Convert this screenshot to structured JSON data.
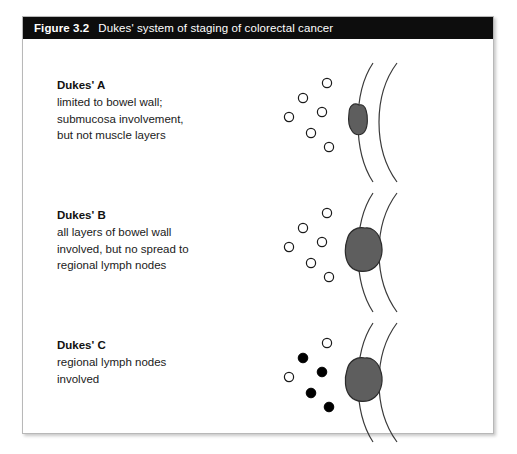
{
  "figure": {
    "number": "Figure 3.2",
    "title": "Dukes' system of staging of colorectal cancer"
  },
  "stages": [
    {
      "id": "dukes-a",
      "label": "Dukes' A",
      "description_lines": [
        "limited to bowel wall;",
        "submucosa involvement,",
        "but not muscle layers"
      ],
      "diagram": {
        "tumor_size": "small",
        "tumor_position": "inner-wall",
        "lymph_nodes": [
          {
            "cx": 46,
            "cy": 26,
            "filled": false
          },
          {
            "cx": 22,
            "cy": 41,
            "filled": false
          },
          {
            "cx": 41,
            "cy": 55,
            "filled": false
          },
          {
            "cx": 8,
            "cy": 60,
            "filled": false
          },
          {
            "cx": 30,
            "cy": 76,
            "filled": false
          },
          {
            "cx": 48,
            "cy": 90,
            "filled": false
          }
        ]
      }
    },
    {
      "id": "dukes-b",
      "label": "Dukes' B",
      "description_lines": [
        "all layers of bowel wall",
        "involved, but no spread to",
        "regional lymph nodes"
      ],
      "diagram": {
        "tumor_size": "large",
        "tumor_position": "full-thickness",
        "lymph_nodes": [
          {
            "cx": 46,
            "cy": 26,
            "filled": false
          },
          {
            "cx": 22,
            "cy": 41,
            "filled": false
          },
          {
            "cx": 41,
            "cy": 55,
            "filled": false
          },
          {
            "cx": 8,
            "cy": 60,
            "filled": false
          },
          {
            "cx": 30,
            "cy": 76,
            "filled": false
          },
          {
            "cx": 48,
            "cy": 90,
            "filled": false
          }
        ]
      }
    },
    {
      "id": "dukes-c",
      "label": "Dukes' C",
      "description_lines": [
        "regional lymph nodes",
        "involved"
      ],
      "diagram": {
        "tumor_size": "large",
        "tumor_position": "full-thickness",
        "lymph_nodes": [
          {
            "cx": 46,
            "cy": 26,
            "filled": false
          },
          {
            "cx": 22,
            "cy": 41,
            "filled": true
          },
          {
            "cx": 41,
            "cy": 55,
            "filled": true
          },
          {
            "cx": 8,
            "cy": 60,
            "filled": false
          },
          {
            "cx": 30,
            "cy": 76,
            "filled": true
          },
          {
            "cx": 48,
            "cy": 90,
            "filled": true
          }
        ]
      }
    }
  ],
  "colors": {
    "title_bar": "#0d0d0d",
    "title_text": "#ffffff",
    "border": "#b8b8b8",
    "tumor_fill": "#5e5e5e",
    "tumor_stroke": "#2b2b2b",
    "wall_line": "#3a3a3a",
    "node_stroke": "#1a1a1a",
    "node_filled": "#000000",
    "background": "#ffffff"
  }
}
